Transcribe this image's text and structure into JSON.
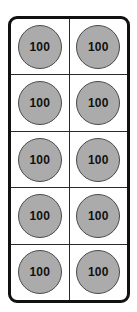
{
  "diagram": {
    "frame": {
      "border_color": "#111111",
      "fill_color": "#ffffff",
      "divider_color": "#2a2a2a",
      "rows": 5,
      "columns": 2,
      "total_cells": 10
    },
    "token": {
      "shape": "circle",
      "fill_color": "#ababab",
      "border_color": "#4a4a4a",
      "label_color": "#111111"
    },
    "cells": [
      [
        {
          "label": "100"
        },
        {
          "label": "100"
        }
      ],
      [
        {
          "label": "100"
        },
        {
          "label": "100"
        }
      ],
      [
        {
          "label": "100"
        },
        {
          "label": "100"
        }
      ],
      [
        {
          "label": "100"
        },
        {
          "label": "100"
        }
      ],
      [
        {
          "label": "100"
        },
        {
          "label": "100"
        }
      ]
    ]
  }
}
